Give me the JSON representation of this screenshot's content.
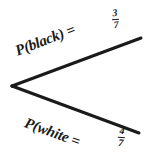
{
  "figure": {
    "type": "probability-tree-branch",
    "background_color": "#ffffff",
    "ink_color": "#1a1a1a",
    "vertex_label": "branch-node"
  },
  "branches": [
    {
      "id": "black-branch",
      "outcome_text": "P(black) =",
      "probability": {
        "numerator": "3",
        "denominator": "7"
      },
      "direction": "up-right"
    },
    {
      "id": "white-branch",
      "outcome_text": "P(white =",
      "probability": {
        "numerator": "4",
        "denominator": "7"
      },
      "direction": "down-right"
    }
  ],
  "geometry": {
    "vertex": {
      "x": 12,
      "y": 86
    },
    "upper_end": {
      "x": 141,
      "y": 38
    },
    "lower_end": {
      "x": 139,
      "y": 133
    },
    "stroke_width": 3
  }
}
